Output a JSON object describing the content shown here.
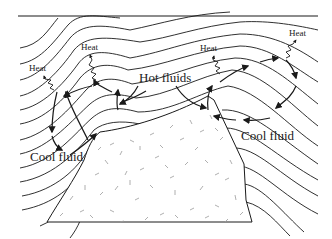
{
  "diagram": {
    "colors": {
      "line": "#1a1a1a",
      "speckle": "#9a9a9a",
      "background": "#ffffff"
    },
    "labels": {
      "heat_left": "Heat",
      "heat_left_center": "Heat",
      "hot_fluids": "Hot fluids",
      "heat_right_center": "Heat",
      "heat_right": "Heat",
      "cool_fluid_left": "Cool fluid",
      "cool_fluid_right": "Cool fluid"
    },
    "regions": [
      {
        "name": "country-rock-layers",
        "description": "wavy stratified layers draped over intrusion"
      },
      {
        "name": "intrusion-pluton",
        "description": "speckled igneous body"
      }
    ],
    "arrows": [
      {
        "name": "hot-fluid-flow",
        "direction": "upward/outward from pluton top"
      },
      {
        "name": "cool-fluid-flow",
        "direction": "downward toward pluton flanks"
      },
      {
        "name": "heat-escape",
        "direction": "wavy arrows upward"
      }
    ]
  }
}
